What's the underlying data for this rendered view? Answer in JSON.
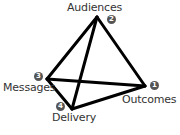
{
  "diagram": {
    "type": "tetrahedron",
    "nodes": [
      {
        "id": "audiences",
        "label": "Audiences",
        "number": "2",
        "x": 97,
        "y": 17
      },
      {
        "id": "outcomes",
        "label": "Outcomes",
        "number": "1",
        "x": 145,
        "y": 86
      },
      {
        "id": "messages",
        "label": "Messages",
        "number": "3",
        "x": 47,
        "y": 79
      },
      {
        "id": "delivery",
        "label": "Delivery",
        "number": "4",
        "x": 72,
        "y": 109
      }
    ],
    "edges": [
      [
        "audiences",
        "outcomes"
      ],
      [
        "audiences",
        "messages"
      ],
      [
        "audiences",
        "delivery"
      ],
      [
        "messages",
        "outcomes"
      ],
      [
        "messages",
        "delivery"
      ],
      [
        "delivery",
        "outcomes"
      ]
    ],
    "colors": {
      "edge": "#000000",
      "badge": "#555555",
      "text": "#333333"
    }
  }
}
